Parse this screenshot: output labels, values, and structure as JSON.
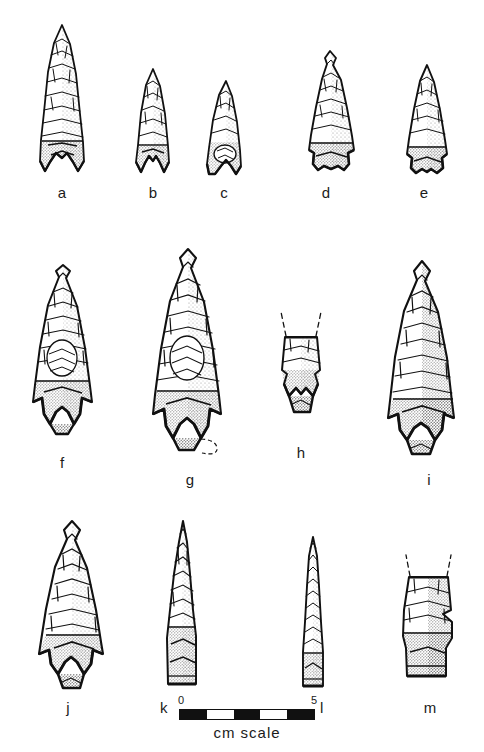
{
  "figure": {
    "kind": "lithic-artifact-plate",
    "background_color": "#ffffff",
    "ink_color": "#111111",
    "specimen_count": 13
  },
  "labels": {
    "a": "a",
    "b": "b",
    "c": "c",
    "d": "d",
    "e": "e",
    "f": "f",
    "g": "g",
    "h": "h",
    "i": "i",
    "j": "j",
    "k": "k",
    "l": "l",
    "m": "m"
  },
  "scale": {
    "start_label": "0",
    "end_label": "5",
    "caption": "cm  scale",
    "unit": "cm",
    "segments": 5,
    "segment_fills": [
      "dark",
      "light",
      "dark",
      "light",
      "dark"
    ]
  },
  "specimens": [
    {
      "id": "a",
      "row": 1,
      "form": "long-triangular-point",
      "base": "deeply-notched",
      "complete": true
    },
    {
      "id": "b",
      "row": 1,
      "form": "small-triangular-point",
      "base": "notched",
      "complete": true
    },
    {
      "id": "c",
      "row": 1,
      "form": "small-triangular-point",
      "base": "notched",
      "complete": true
    },
    {
      "id": "d",
      "row": 1,
      "form": "side-notched-point",
      "base": "stemmed",
      "complete": true
    },
    {
      "id": "e",
      "row": 1,
      "form": "side-notched-point",
      "base": "stemmed",
      "complete": true
    },
    {
      "id": "f",
      "row": 2,
      "form": "barbed-stemmed-point",
      "base": "expanding-stem",
      "complete": true
    },
    {
      "id": "g",
      "row": 2,
      "form": "large-barbed-point",
      "base": "expanding-stem",
      "complete": true
    },
    {
      "id": "h",
      "row": 2,
      "form": "basal-fragment",
      "base": "notched-stem",
      "complete": false
    },
    {
      "id": "i",
      "row": 2,
      "form": "large-barbed-point",
      "base": "broad-stem",
      "complete": true
    },
    {
      "id": "j",
      "row": 3,
      "form": "barbed-stemmed-point",
      "base": "expanding-stem",
      "complete": true
    },
    {
      "id": "k",
      "row": 3,
      "form": "narrow-drill-form",
      "base": "squared",
      "complete": true
    },
    {
      "id": "l",
      "row": 3,
      "form": "elongate-drill-awl",
      "base": "squared",
      "complete": true
    },
    {
      "id": "m",
      "row": 3,
      "form": "basal-fragment",
      "base": "shouldered-stem",
      "complete": false
    }
  ]
}
